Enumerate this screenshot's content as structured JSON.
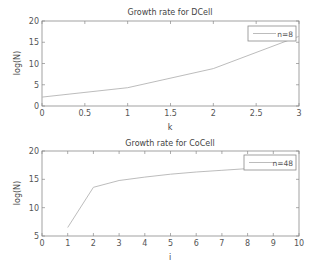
{
  "chart_data": [
    {
      "type": "line",
      "title": "Growth rate for DCell",
      "xlabel": "k",
      "ylabel": "log(N)",
      "xlim": [
        0,
        3
      ],
      "ylim": [
        0,
        20
      ],
      "xticks": [
        0,
        0.5,
        1,
        1.5,
        2,
        2.5,
        3
      ],
      "xtick_labels": [
        "0",
        "0.5",
        "1",
        "1.5",
        "2",
        "2.5",
        "3"
      ],
      "yticks": [
        0,
        5,
        10,
        15,
        20
      ],
      "ytick_labels": [
        "0",
        "5",
        "10",
        "15",
        "20"
      ],
      "grid": false,
      "legend_position": "upper right",
      "series": [
        {
          "name": "n=8",
          "color": "#b4b4b4",
          "x": [
            0,
            1,
            2,
            3
          ],
          "values": [
            2.1,
            4.3,
            8.8,
            16.4
          ]
        }
      ],
      "frame": {
        "left": 42,
        "top": 21,
        "right": 299,
        "bottom": 106
      },
      "legend_box": {
        "x": 248,
        "y": 26,
        "w": 48,
        "h": 15
      },
      "title_pos": {
        "x": 170,
        "y": 15
      },
      "xlabel_pos": {
        "x": 170,
        "y": 130
      },
      "ylabel_pos": {
        "x": 20,
        "y": 63
      }
    },
    {
      "type": "line",
      "title": "Growth rate for CoCell",
      "xlabel": "i",
      "ylabel": "log(N)",
      "xlim": [
        0,
        10
      ],
      "ylim": [
        5,
        20
      ],
      "xticks": [
        0,
        1,
        2,
        3,
        4,
        5,
        6,
        7,
        8,
        9,
        10
      ],
      "xtick_labels": [
        "0",
        "1",
        "2",
        "3",
        "4",
        "5",
        "6",
        "7",
        "8",
        "9",
        "10"
      ],
      "yticks": [
        5,
        10,
        15,
        20
      ],
      "ytick_labels": [
        "5",
        "10",
        "15",
        "20"
      ],
      "grid": false,
      "legend_position": "upper right",
      "series": [
        {
          "name": "n=48",
          "color": "#b4b4b4",
          "x": [
            1,
            2,
            3,
            4,
            5,
            6,
            7,
            8
          ],
          "values": [
            6.5,
            13.6,
            14.8,
            15.4,
            15.9,
            16.3,
            16.6,
            16.9
          ]
        }
      ],
      "frame": {
        "left": 42,
        "top": 151,
        "right": 299,
        "bottom": 236
      },
      "legend_box": {
        "x": 244,
        "y": 155,
        "w": 52,
        "h": 15
      },
      "title_pos": {
        "x": 170,
        "y": 146
      },
      "xlabel_pos": {
        "x": 170,
        "y": 260
      },
      "ylabel_pos": {
        "x": 20,
        "y": 193
      }
    }
  ]
}
